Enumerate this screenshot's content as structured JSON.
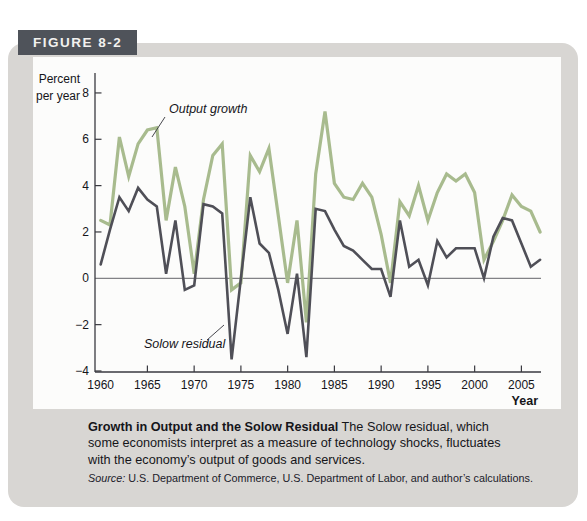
{
  "figure_tag": "FIGURE 8-2",
  "chart": {
    "y_axis_label_line1": "Percent",
    "y_axis_label_line2": "per year",
    "x_axis_label": "Year",
    "annotation_output": "Output growth",
    "annotation_solow": "Solow residual"
  },
  "chart_data": {
    "type": "line",
    "title": "",
    "xlabel": "Year",
    "ylabel": "Percent per year",
    "ylim": [
      -4,
      8
    ],
    "yticks": [
      8,
      6,
      4,
      2,
      0,
      -2,
      -4
    ],
    "xticks": [
      1960,
      1965,
      1970,
      1975,
      1980,
      1985,
      1990,
      1995,
      2000,
      2005
    ],
    "grid": false,
    "legend_position": "inline-annotations",
    "x": [
      1960,
      1961,
      1962,
      1963,
      1964,
      1965,
      1966,
      1967,
      1968,
      1969,
      1970,
      1971,
      1972,
      1973,
      1974,
      1975,
      1976,
      1977,
      1978,
      1979,
      1980,
      1981,
      1982,
      1983,
      1984,
      1985,
      1986,
      1987,
      1988,
      1989,
      1990,
      1991,
      1992,
      1993,
      1994,
      1995,
      1996,
      1997,
      1998,
      1999,
      2000,
      2001,
      2002,
      2003,
      2004,
      2005,
      2006,
      2007
    ],
    "series": [
      {
        "name": "Output growth",
        "color": "#a8bb8e",
        "values": [
          2.5,
          2.3,
          6.1,
          4.4,
          5.8,
          6.4,
          6.5,
          2.5,
          4.8,
          3.1,
          0.2,
          3.4,
          5.3,
          5.8,
          -0.5,
          -0.2,
          5.3,
          4.6,
          5.6,
          2.7,
          -0.2,
          2.5,
          -1.9,
          4.5,
          7.2,
          4.1,
          3.5,
          3.4,
          4.1,
          3.5,
          1.9,
          -0.2,
          3.3,
          2.7,
          4.0,
          2.5,
          3.7,
          4.5,
          4.2,
          4.5,
          3.7,
          0.8,
          1.6,
          2.5,
          3.6,
          3.1,
          2.9,
          2.0
        ]
      },
      {
        "name": "Solow residual",
        "color": "#4f4f57",
        "values": [
          0.6,
          2.1,
          3.5,
          2.9,
          3.9,
          3.4,
          3.1,
          0.2,
          2.5,
          -0.5,
          -0.3,
          3.2,
          3.1,
          2.8,
          -3.5,
          0.0,
          3.5,
          1.5,
          1.1,
          -0.5,
          -2.4,
          0.2,
          -3.4,
          3.0,
          2.9,
          2.1,
          1.4,
          1.2,
          0.8,
          0.4,
          0.4,
          -0.8,
          2.5,
          0.5,
          0.8,
          -0.3,
          1.6,
          0.9,
          1.3,
          1.3,
          1.3,
          0.0,
          1.8,
          2.6,
          2.5,
          1.5,
          0.5,
          0.8
        ]
      }
    ]
  },
  "caption": {
    "title": "Growth in Output and the Solow Residual",
    "body": "The Solow residual, which some economists interpret as a measure of technology shocks, fluctuates with the economy’s output of goods and services."
  },
  "source": {
    "prefix": "Source:",
    "text": "U.S. Department of Commerce, U.S. Department of Labor, and author’s calculations."
  }
}
